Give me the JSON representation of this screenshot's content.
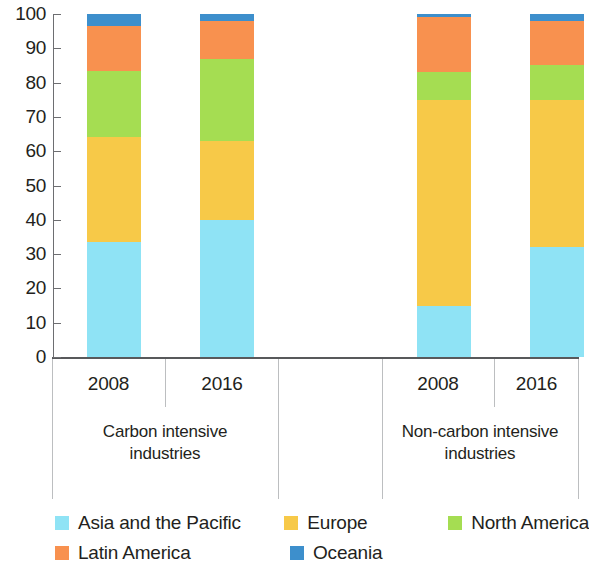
{
  "chart_data": {
    "type": "bar",
    "subtype": "stacked-percentage",
    "title": "",
    "xlabel": "",
    "ylabel": "",
    "ylim": [
      0,
      100
    ],
    "ytick_labels": [
      "100",
      "90",
      "80",
      "70",
      "60",
      "50",
      "40",
      "30",
      "20",
      "10",
      "0"
    ],
    "ytick_values": [
      100,
      90,
      80,
      70,
      60,
      50,
      40,
      30,
      20,
      10,
      0
    ],
    "grid": false,
    "legend_position": "bottom",
    "groups": [
      {
        "label": "Carbon intensive industries",
        "label_line1": "Carbon intensive",
        "label_line2": "industries"
      },
      {
        "label": "Non-carbon intensive industries",
        "label_line1": "Non-carbon intensive",
        "label_line2": "industries"
      }
    ],
    "categories": [
      "2008",
      "2016",
      "2008",
      "2016"
    ],
    "category_groups": [
      "Carbon intensive industries",
      "Carbon intensive industries",
      "Non-carbon intensive industries",
      "Non-carbon intensive industries"
    ],
    "series": [
      {
        "name": "Asia and the Pacific",
        "color": "#8FE3F5",
        "values": [
          33.5,
          40,
          15,
          32
        ]
      },
      {
        "name": "Europe",
        "color": "#F7C948",
        "values": [
          30.5,
          23,
          60,
          43
        ]
      },
      {
        "name": "North America",
        "color": "#A5DD52",
        "values": [
          19.5,
          24,
          8,
          10
        ]
      },
      {
        "name": "Latin America",
        "color": "#F8914F",
        "values": [
          13,
          11,
          16,
          13
        ]
      },
      {
        "name": "Oceania",
        "color": "#3D8FCC",
        "values": [
          3.5,
          2,
          1,
          2
        ]
      }
    ]
  },
  "legend": {
    "items": [
      {
        "label": "Asia and the Pacific",
        "color": "#8FE3F5",
        "swatch_icon": "legend-swatch-icon"
      },
      {
        "label": "Europe",
        "color": "#F7C948",
        "swatch_icon": "legend-swatch-icon"
      },
      {
        "label": "North America",
        "color": "#A5DD52",
        "swatch_icon": "legend-swatch-icon"
      },
      {
        "label": "Latin America",
        "color": "#F8914F",
        "swatch_icon": "legend-swatch-icon"
      },
      {
        "label": "Oceania",
        "color": "#3D8FCC",
        "swatch_icon": "legend-swatch-icon"
      }
    ]
  }
}
